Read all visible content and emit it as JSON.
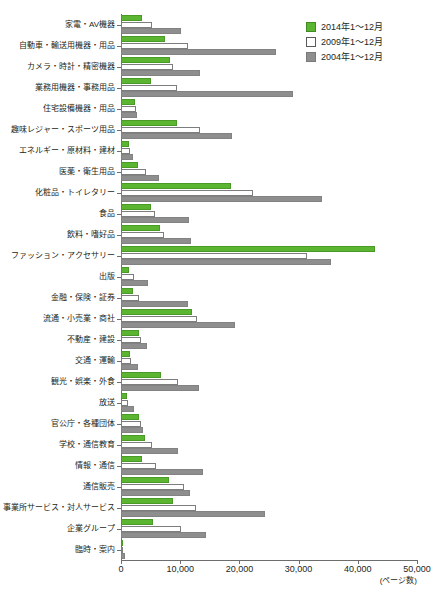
{
  "chart_data": {
    "type": "bar",
    "orientation": "horizontal",
    "title": "",
    "xlabel": "(ページ数)",
    "ylabel": "",
    "xlim": [
      0,
      50000
    ],
    "xticks": [
      0,
      10000,
      20000,
      30000,
      40000,
      50000
    ],
    "xtick_labels": [
      "0",
      "10,000",
      "20,000",
      "30,000",
      "40,000",
      "50,000"
    ],
    "grid": false,
    "legend_position": "top-right",
    "categories": [
      "家電・AV機器",
      "自動車・輸送用機器・用品",
      "カメラ・時計・精密機器",
      "業務用機器・事務用品",
      "住宅設備機器・用品",
      "趣味レジャー・スポーツ用品",
      "エネルギー・原材料・建材",
      "医薬・衛生用品",
      "化粧品・トイレタリー",
      "食品",
      "飲料・嗜好品",
      "ファッション・アクセサリー",
      "出版",
      "金融・保険・証券",
      "流通・小売業・商社",
      "不動産・建設",
      "交通・運輸",
      "観光・娯楽・外食",
      "放送",
      "官公庁・各種団体",
      "学校・通信教育",
      "情報・通信",
      "通信販売",
      "事業所サービス・対人サービス",
      "企業グループ",
      "臨時・案内"
    ],
    "series": [
      {
        "name": "2014年1～12月",
        "color": "#5cb531",
        "values": [
          3600,
          7500,
          8200,
          5100,
          2400,
          9500,
          1400,
          2900,
          18500,
          5100,
          6600,
          42900,
          1300,
          2100,
          12000,
          3000,
          1600,
          6800,
          1000,
          3100,
          4000,
          3500,
          8100,
          8700,
          5400,
          200
        ]
      },
      {
        "name": "2009年1～12月",
        "color": "#ffffff",
        "values": [
          5200,
          11300,
          8700,
          9500,
          2500,
          13400,
          1500,
          4200,
          22300,
          5800,
          7300,
          31500,
          2200,
          3000,
          12900,
          3300,
          1700,
          9700,
          1100,
          3400,
          5300,
          5900,
          10700,
          12700,
          10200,
          300
        ]
      },
      {
        "name": "2004年1～12月",
        "color": "#8e8e8e",
        "values": [
          10200,
          26200,
          13400,
          29000,
          2700,
          18800,
          2000,
          6500,
          34000,
          11500,
          11900,
          35400,
          4500,
          11400,
          19300,
          4400,
          2900,
          13100,
          2200,
          3700,
          9700,
          13900,
          11700,
          24300,
          14400,
          600
        ]
      }
    ],
    "legend": [
      {
        "label": "2014年1～12月",
        "swatch": "s-2014"
      },
      {
        "label": "2009年1～12月",
        "swatch": "s-2009"
      },
      {
        "label": "2004年1～12月",
        "swatch": "s-2004"
      }
    ]
  }
}
